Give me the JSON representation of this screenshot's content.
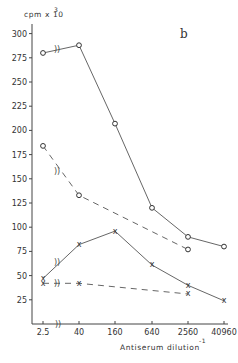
{
  "chart_data": {
    "type": "line",
    "panel_label": "b",
    "title": "",
    "xlabel": "Antiserum dilution",
    "xlabel_superscript": "-1",
    "ylabel": "cpm x 10",
    "ylabel_superscript": "3",
    "x_scale": "log4",
    "x_ticks": [
      2.5,
      40,
      160,
      640,
      2560,
      40960
    ],
    "x_tick_labels": [
      "2.5",
      "40",
      "160",
      "640",
      "2560",
      "40960"
    ],
    "x_axis_break_between": [
      "2.5",
      "40"
    ],
    "y_ticks": [
      25,
      50,
      75,
      100,
      125,
      150,
      175,
      200,
      225,
      250,
      275,
      300
    ],
    "y_tick_labels": [
      "25",
      "50",
      "75",
      "100",
      "125",
      "150",
      "175",
      "200",
      "225",
      "250",
      "275",
      "300"
    ],
    "ylim": [
      0,
      310
    ],
    "grid": false,
    "series": [
      {
        "name": "open circles, solid",
        "marker": "o",
        "line": "solid",
        "x": [
          "2.5",
          "40",
          "160",
          "640",
          "2560",
          "40960"
        ],
        "values": [
          280,
          288,
          207,
          120,
          90,
          80
        ]
      },
      {
        "name": "open circles, dashed",
        "marker": "o",
        "line": "dashed",
        "x": [
          "2.5",
          "40",
          "2560"
        ],
        "values": [
          184,
          133,
          77
        ]
      },
      {
        "name": "crosses, solid",
        "marker": "x",
        "line": "solid",
        "x": [
          "2.5",
          "40",
          "160",
          "640",
          "2560",
          "40960"
        ],
        "values": [
          47,
          82,
          96,
          61,
          40,
          24
        ]
      },
      {
        "name": "crosses, dashed",
        "marker": "x",
        "line": "dashed",
        "x": [
          "2.5",
          "40",
          "2560"
        ],
        "values": [
          42,
          42,
          31
        ]
      }
    ]
  }
}
